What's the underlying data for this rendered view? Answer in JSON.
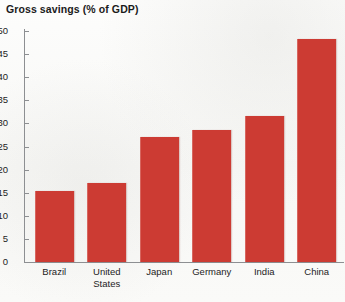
{
  "chart_data": {
    "type": "bar",
    "title": "Gross savings (% of GDP)",
    "xlabel": "",
    "ylabel": "",
    "categories": [
      "Brazil",
      "United States",
      "Japan",
      "Germany",
      "India",
      "China"
    ],
    "values": [
      15.3,
      17.2,
      27.0,
      28.5,
      31.5,
      48.2
    ],
    "series": [
      {
        "name": "Gross savings (% of GDP)",
        "values": [
          15.3,
          17.2,
          27.0,
          28.5,
          31.5,
          48.2
        ]
      }
    ],
    "ylim": [
      0,
      50
    ],
    "ytick_step": 5,
    "yticks": [
      0,
      5,
      10,
      15,
      20,
      25,
      30,
      35,
      40,
      45,
      50
    ],
    "ytick_labels": [
      "0",
      "5",
      "10",
      "15",
      "20",
      "25",
      "30",
      "35",
      "40",
      "45",
      "50"
    ],
    "grid": false,
    "legend": false,
    "legend_position": "none",
    "bar_color": "#cc3b33",
    "background_color": "#fbfbfa",
    "axis_color": "#8d8f92",
    "text_color": "#1d1d1d"
  }
}
